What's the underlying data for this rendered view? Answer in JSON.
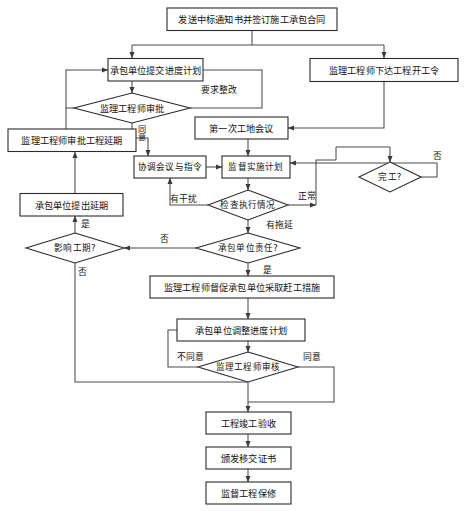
{
  "diagram": {
    "type": "flowchart",
    "canvas": {
      "width": 464,
      "height": 511
    },
    "style": {
      "background": "#ffffff",
      "node_fill": "#ffffff",
      "node_stroke": "#2b2b2b",
      "edge_stroke": "#4a4a4a",
      "text_color": "#111111"
    },
    "nodes": [
      {
        "id": "n1",
        "shape": "rect",
        "label": "发送中标通知书并签订施工承包合同"
      },
      {
        "id": "n2",
        "shape": "rect",
        "label": "承包单位提交进度计划"
      },
      {
        "id": "n3",
        "shape": "rect",
        "label": "监理工程师下达工程开工令"
      },
      {
        "id": "n4",
        "shape": "diamond",
        "label": "监理工程师审批"
      },
      {
        "id": "n5",
        "shape": "rect",
        "label": "监理工程师审批工程延期"
      },
      {
        "id": "n6",
        "shape": "rect",
        "label": "第一次工地会议"
      },
      {
        "id": "n7",
        "shape": "rect",
        "label": "协调会议与指令"
      },
      {
        "id": "n8",
        "shape": "rect",
        "label": "监督实施计划"
      },
      {
        "id": "n9",
        "shape": "rect",
        "label": "承包单位提出延期"
      },
      {
        "id": "n10",
        "shape": "diamond",
        "label": "检查执行情况"
      },
      {
        "id": "n11",
        "shape": "diamond",
        "label": "完工?"
      },
      {
        "id": "n12",
        "shape": "diamond",
        "label": "影响工期?"
      },
      {
        "id": "n13",
        "shape": "diamond",
        "label": "承包单位责任?"
      },
      {
        "id": "n14",
        "shape": "rect",
        "label": "监理工程师督促承包单位采取赶工措施"
      },
      {
        "id": "n15",
        "shape": "rect",
        "label": "承包单位调整进度计划"
      },
      {
        "id": "n16",
        "shape": "diamond",
        "label": "监理工程师审核"
      },
      {
        "id": "n17",
        "shape": "rect",
        "label": "工程竣工验收"
      },
      {
        "id": "n18",
        "shape": "rect",
        "label": "颁发移交证书"
      },
      {
        "id": "n19",
        "shape": "rect",
        "label": "监督工程保修"
      }
    ],
    "edge_labels": [
      {
        "id": "e1",
        "text": "要求整改",
        "from": "n4",
        "to": "n2"
      },
      {
        "id": "e2",
        "text": "同意",
        "from": "n4",
        "to": "n7",
        "orientation": "vertical"
      },
      {
        "id": "e3",
        "text": "有干扰",
        "from": "n10",
        "to": "n7"
      },
      {
        "id": "e4",
        "text": "正常",
        "from": "n10",
        "to": "n11"
      },
      {
        "id": "e5",
        "text": "有拖延",
        "from": "n10",
        "to": "n13"
      },
      {
        "id": "e6",
        "text": "否",
        "from": "n11",
        "to": "n8"
      },
      {
        "id": "e7",
        "text": "否",
        "from": "n13",
        "to": "n12"
      },
      {
        "id": "e8",
        "text": "是",
        "from": "n13",
        "to": "n14"
      },
      {
        "id": "e9",
        "text": "是",
        "from": "n12",
        "to": "n9"
      },
      {
        "id": "e10",
        "text": "否",
        "from": "n12",
        "to": "n15"
      },
      {
        "id": "e11",
        "text": "不同意",
        "from": "n16",
        "to": "n15"
      },
      {
        "id": "e12",
        "text": "同意",
        "from": "n16",
        "to": "n17"
      }
    ]
  }
}
